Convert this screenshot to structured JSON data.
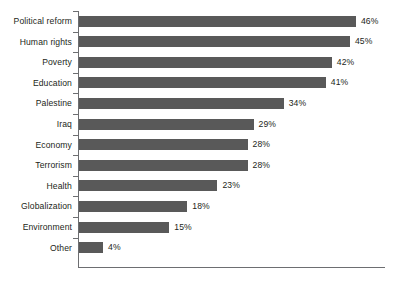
{
  "chart_data": {
    "type": "bar",
    "orientation": "horizontal",
    "title": "",
    "subtitle": "",
    "xlabel": "",
    "ylabel": "",
    "xlim": [
      0,
      50
    ],
    "grid": false,
    "legend": null,
    "bar_color": "#595959",
    "axis_color": "#6d6e71",
    "background_color": "#ffffff",
    "value_suffix": "%",
    "categories": [
      "Political reform",
      "Human rights",
      "Poverty",
      "Education",
      "Palestine",
      "Iraq",
      "Economy",
      "Terrorism",
      "Health",
      "Globalization",
      "Environment",
      "Other"
    ],
    "values": [
      46,
      45,
      42,
      41,
      34,
      29,
      28,
      28,
      23,
      18,
      15,
      4
    ],
    "value_labels": [
      "46%",
      "45%",
      "42%",
      "41%",
      "34%",
      "29%",
      "28%",
      "28%",
      "23%",
      "18%",
      "15%",
      "4%"
    ]
  }
}
